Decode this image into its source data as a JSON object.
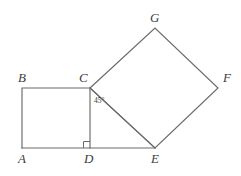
{
  "figure": {
    "width": 241,
    "height": 176,
    "background_color": "#ffffff",
    "stroke_color": "#6a6a6a",
    "label_color": "#3c3c3c"
  },
  "vertices": [
    {
      "name": "A",
      "label": "A",
      "x": 22,
      "y": 148,
      "label_x": 18,
      "label_y": 163
    },
    {
      "name": "B",
      "label": "B",
      "x": 22,
      "y": 88,
      "label_x": 18,
      "label_y": 82
    },
    {
      "name": "C",
      "label": "C",
      "x": 90,
      "y": 88,
      "label_x": 79,
      "label_y": 82
    },
    {
      "name": "D",
      "label": "D",
      "x": 90,
      "y": 148,
      "label_x": 84,
      "label_y": 163
    },
    {
      "name": "E",
      "label": "E",
      "x": 155,
      "y": 148,
      "label_x": 151,
      "label_y": 163
    },
    {
      "name": "F",
      "label": "F",
      "x": 218,
      "y": 88,
      "label_x": 223,
      "label_y": 82
    },
    {
      "name": "G",
      "label": "G",
      "x": 155,
      "y": 28,
      "label_x": 150,
      "label_y": 22
    }
  ],
  "shapes": {
    "square_abcd": {
      "name": "square-abcd",
      "points": "22,148 22,88 90,88 90,148"
    },
    "square_cgfe": {
      "name": "square-cgfe",
      "points": "90,88 155,28 218,88 155,148"
    },
    "baseline": {
      "name": "baseline-a-to-e",
      "x1": 22,
      "y1": 148,
      "x2": 155,
      "y2": 148
    },
    "diagonal_ce": {
      "name": "diagonal-c-to-e",
      "x1": 90,
      "y1": 88,
      "x2": 155,
      "y2": 148
    }
  },
  "annotations": {
    "angle_45": {
      "label": "45°",
      "x": 94,
      "y": 103
    },
    "right_angle_marker": {
      "label": "right-angle-at-D",
      "points": "83.5,148 83.5,141.5 90,141.5"
    }
  }
}
